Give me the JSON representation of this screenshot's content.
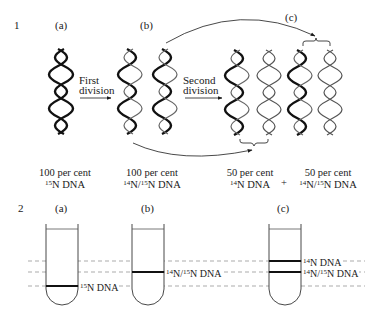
{
  "panel1": {
    "number": "1",
    "labels": {
      "a": "(a)",
      "b": "(b)",
      "c": "(c)"
    },
    "arrows": {
      "first": {
        "line1": "First",
        "line2": "division"
      },
      "second": {
        "line1": "Second",
        "line2": "division"
      }
    },
    "captions": {
      "a": {
        "line1": "100 per cent",
        "sup": "15",
        "rest": "N DNA"
      },
      "b": {
        "line1": "100 per cent",
        "sup1": "14",
        "mid": "N/",
        "sup2": "15",
        "rest": "N DNA"
      },
      "c1": {
        "line1": "50 per cent",
        "sup": "14",
        "rest": "N DNA"
      },
      "plus": "+",
      "c2": {
        "line1": "50 per cent",
        "sup1": "14",
        "mid": "N/",
        "sup2": "15",
        "rest": "N DNA"
      }
    }
  },
  "panel2": {
    "number": "2",
    "labels": {
      "a": "(a)",
      "b": "(b)",
      "c": "(c)"
    },
    "bands": {
      "a": {
        "sup": "15",
        "rest": "N DNA"
      },
      "b": {
        "sup1": "14",
        "mid": "N/",
        "sup2": "15",
        "rest": "N DNA"
      },
      "c_top": {
        "sup": "14",
        "rest": "N DNA"
      },
      "c_bottom": {
        "sup1": "14",
        "mid": "N/",
        "sup2": "15",
        "rest": "N DNA"
      }
    }
  },
  "colors": {
    "ink": "#1a1a1a",
    "heavy_strand": "#111111",
    "light_strand": "#555555",
    "dashed": "#888888"
  }
}
